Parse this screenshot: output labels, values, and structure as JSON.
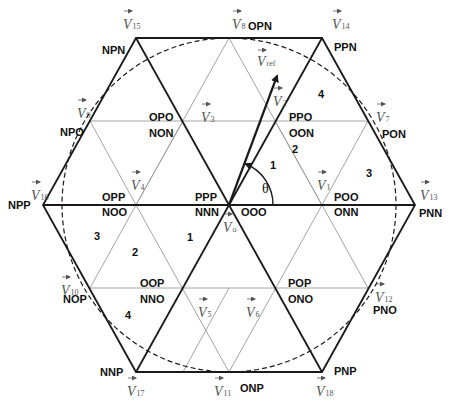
{
  "diagram": {
    "type": "three-level space vector diagram",
    "colors": {
      "thick_line": "#1a1a1a",
      "thin_line": "#9a9a9a",
      "dashed_circle": "#1a1a1a",
      "vector_label": "#555555",
      "state_label": "#111111"
    },
    "vectors": [
      {
        "id": "V0",
        "label": "V",
        "sub": "o",
        "x": 229,
        "y": 205
      },
      {
        "id": "V1",
        "label": "V",
        "sub": "1",
        "x": 322,
        "y": 205
      },
      {
        "id": "V2",
        "label": "V",
        "sub": "2",
        "x": 275,
        "y": 121
      },
      {
        "id": "V3",
        "label": "V",
        "sub": "3",
        "x": 183,
        "y": 121
      },
      {
        "id": "V4",
        "label": "V",
        "sub": "4",
        "x": 136,
        "y": 205
      },
      {
        "id": "V5",
        "label": "V",
        "sub": "5",
        "x": 183,
        "y": 288
      },
      {
        "id": "V6",
        "label": "V",
        "sub": "6",
        "x": 275,
        "y": 288
      },
      {
        "id": "V7",
        "label": "V",
        "sub": "7",
        "x": 368,
        "y": 121
      },
      {
        "id": "V8",
        "label": "V",
        "sub": "8",
        "x": 229,
        "y": 38
      },
      {
        "id": "V9",
        "label": "V",
        "sub": "9",
        "x": 90,
        "y": 121
      },
      {
        "id": "V10",
        "label": "V",
        "sub": "10",
        "x": 90,
        "y": 288
      },
      {
        "id": "V11",
        "label": "V",
        "sub": "11",
        "x": 229,
        "y": 372
      },
      {
        "id": "V12",
        "label": "V",
        "sub": "12",
        "x": 368,
        "y": 288
      },
      {
        "id": "V13",
        "label": "V",
        "sub": "13",
        "x": 415,
        "y": 205
      },
      {
        "id": "V14",
        "label": "V",
        "sub": "14",
        "x": 322,
        "y": 38
      },
      {
        "id": "V15",
        "label": "V",
        "sub": "15",
        "x": 136,
        "y": 38
      },
      {
        "id": "V16",
        "label": "V",
        "sub": "16",
        "x": 43,
        "y": 205
      },
      {
        "id": "V17",
        "label": "V",
        "sub": "17",
        "x": 136,
        "y": 372
      },
      {
        "id": "V18",
        "label": "V",
        "sub": "18",
        "x": 322,
        "y": 372
      }
    ],
    "vref": {
      "label": "V",
      "sub": "ref",
      "from": [
        229,
        205
      ],
      "to": [
        277,
        74
      ]
    },
    "theta_label": "θ",
    "switching_states": {
      "V0": [
        "PPP",
        "OOO",
        "NNN"
      ],
      "V1": [
        "POO",
        "ONN"
      ],
      "V2": [
        "PPO",
        "OON"
      ],
      "V3": [
        "OPO",
        "NON"
      ],
      "V4": [
        "OPP",
        "NOO"
      ],
      "V5": [
        "OOP",
        "NNO"
      ],
      "V6": [
        "POP",
        "ONO"
      ],
      "V7": "PON",
      "V8": "OPN",
      "V9": "NPO",
      "V10": "NOP",
      "V11": "ONP",
      "V12": "PNO",
      "V13": "PNN",
      "V14": "PPN",
      "V15": "NPN",
      "V16": "NPP",
      "V17": "NNP",
      "V18": "PNP"
    },
    "region_labels": {
      "sector1_r1": "1",
      "sector1_r2": "2",
      "sector1_r3": "3",
      "sector1_r4": "4",
      "sector4_r1": "1",
      "sector4_r2": "2",
      "sector4_r3": "3",
      "sector4_r4": "4"
    }
  }
}
